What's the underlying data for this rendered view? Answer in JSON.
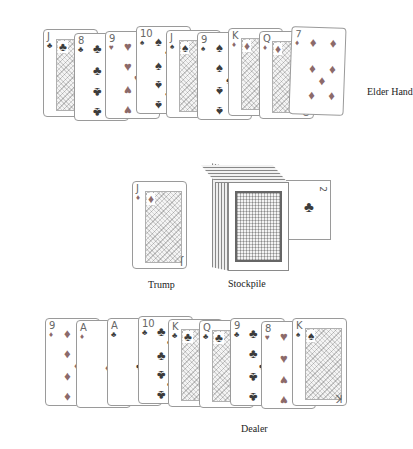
{
  "labels": {
    "elder_hand": "Elder Hand",
    "trump": "Trump",
    "stockpile": "Stockpile",
    "dealer": "Dealer"
  },
  "elder_hand": [
    {
      "rank": "J",
      "suit": "♣",
      "color": "black",
      "face": true
    },
    {
      "rank": "8",
      "suit": "♣",
      "color": "black",
      "face": false
    },
    {
      "rank": "9",
      "suit": "♥",
      "color": "red",
      "face": false
    },
    {
      "rank": "10",
      "suit": "♠",
      "color": "black",
      "face": false
    },
    {
      "rank": "J",
      "suit": "♠",
      "color": "black",
      "face": true
    },
    {
      "rank": "9",
      "suit": "♠",
      "color": "black",
      "face": false
    },
    {
      "rank": "K",
      "suit": "♦",
      "color": "red",
      "face": true
    },
    {
      "rank": "Q",
      "suit": "♦",
      "color": "red",
      "face": true
    },
    {
      "rank": "7",
      "suit": "♦",
      "color": "red",
      "face": false
    }
  ],
  "trump_card": {
    "rank": "J",
    "suit": "♦",
    "color": "red",
    "face": true
  },
  "stockpile_side_card": {
    "rank": "2",
    "suit": "♣",
    "color": "black"
  },
  "dealer_hand": [
    {
      "rank": "9",
      "suit": "♦",
      "color": "red",
      "face": false
    },
    {
      "rank": "A",
      "suit": "♦",
      "color": "red",
      "face": false
    },
    {
      "rank": "A",
      "suit": "♣",
      "color": "black",
      "face": false
    },
    {
      "rank": "10",
      "suit": "♣",
      "color": "black",
      "face": false
    },
    {
      "rank": "K",
      "suit": "♣",
      "color": "black",
      "face": true
    },
    {
      "rank": "Q",
      "suit": "♣",
      "color": "black",
      "face": true
    },
    {
      "rank": "9",
      "suit": "♣",
      "color": "black",
      "face": false
    },
    {
      "rank": "8",
      "suit": "♥",
      "color": "red",
      "face": false
    },
    {
      "rank": "K",
      "suit": "♠",
      "color": "black",
      "face": true
    }
  ]
}
